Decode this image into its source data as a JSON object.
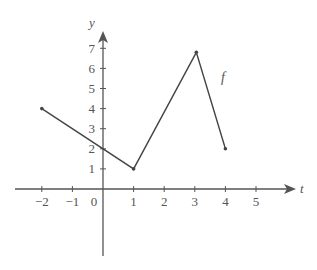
{
  "chart_data": {
    "type": "line",
    "title": "",
    "xlabel": "t",
    "ylabel": "y",
    "function_label": "f",
    "xlim": [
      -3,
      6
    ],
    "ylim": [
      -4,
      8
    ],
    "grid": false,
    "legend": "none",
    "x_ticks": [
      -2,
      -1,
      1,
      2,
      3,
      4,
      5
    ],
    "x_tick_labels": [
      "−2",
      "−1",
      "1",
      "2",
      "3",
      "4",
      "5"
    ],
    "origin_label": "0",
    "y_ticks": [
      1,
      2,
      3,
      4,
      5,
      6,
      7
    ],
    "y_tick_labels": [
      "1",
      "2",
      "3",
      "4",
      "5",
      "6",
      "7"
    ],
    "series": [
      {
        "name": "f",
        "x": [
          -2,
          1,
          3.05,
          4
        ],
        "y": [
          4,
          1,
          6.8,
          2
        ],
        "endpoints_marked": true
      }
    ],
    "colors": {
      "line": "#444444",
      "axis": "#555555",
      "text": "#555555"
    }
  }
}
